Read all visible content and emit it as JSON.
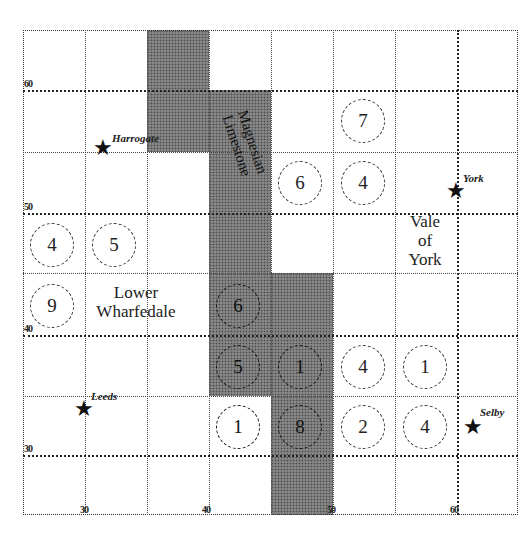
{
  "map": {
    "shading_color": "#7a7a7a",
    "grid": {
      "x_labels": [
        "30",
        "40",
        "50",
        "60"
      ],
      "y_labels": [
        "60",
        "50",
        "40",
        "30"
      ]
    },
    "regions": {
      "magnesian_limestone": {
        "line1": "Magnesian",
        "line2": "Limestone"
      },
      "vale_of_york": {
        "line1": "Vale",
        "line2": "of",
        "line3": "York"
      },
      "lower_wharfedale": {
        "line1": "Lower",
        "line2": "Wharfedale"
      }
    },
    "towns": [
      {
        "name": "Harrogate",
        "icon": "star-icon"
      },
      {
        "name": "York",
        "icon": "star-icon"
      },
      {
        "name": "Leeds",
        "icon": "star-icon"
      },
      {
        "name": "Selby",
        "icon": "star-icon"
      }
    ],
    "sites": [
      {
        "value": "7"
      },
      {
        "value": "6"
      },
      {
        "value": "4"
      },
      {
        "value": "4"
      },
      {
        "value": "5"
      },
      {
        "value": "9"
      },
      {
        "value": "6"
      },
      {
        "value": "5"
      },
      {
        "value": "1"
      },
      {
        "value": "4"
      },
      {
        "value": "1"
      },
      {
        "value": "1"
      },
      {
        "value": "8"
      },
      {
        "value": "2"
      },
      {
        "value": "4"
      }
    ],
    "star_glyph": "★"
  }
}
